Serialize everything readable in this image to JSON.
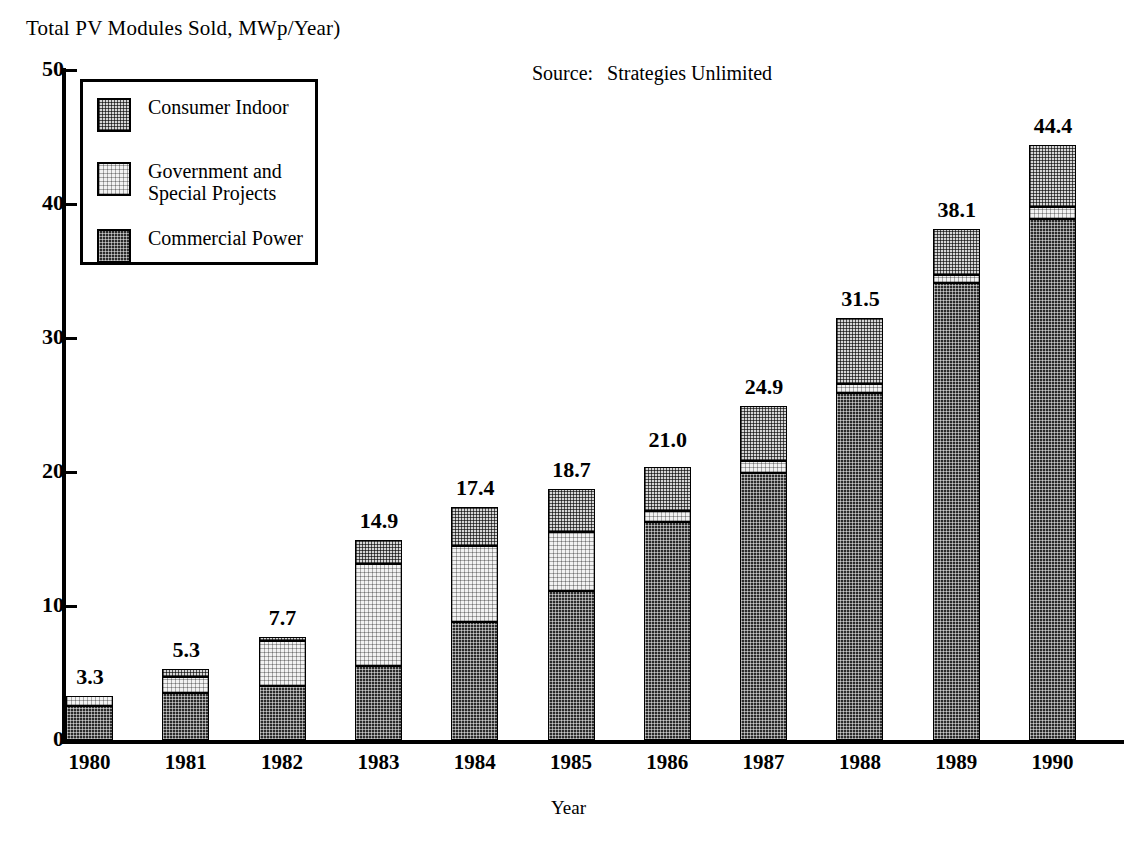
{
  "chart": {
    "y_axis_title": "Total PV Modules Sold, MWp/Year)",
    "x_axis_title": "Year",
    "source_label": "Source:",
    "source_value": "Strategies Unlimited"
  },
  "legend": {
    "items": [
      {
        "label": "Consumer Indoor",
        "swatch": "consumer-indoor-swatch",
        "color": "#d6d6d6"
      },
      {
        "label": "Government and\nSpecial Projects",
        "swatch": "government-special-projects-swatch",
        "color": "#f2f2f2"
      },
      {
        "label": "Commercial Power",
        "swatch": "commercial-power-swatch",
        "color": "#2b2b2b"
      }
    ]
  },
  "chart_data": {
    "type": "bar",
    "subtype": "stacked",
    "title": "Total PV Modules Sold, MWp/Year)",
    "xlabel": "Year",
    "ylabel": "Total PV Modules Sold, MWp/Year)",
    "ylim": [
      0,
      50
    ],
    "yticks": [
      0,
      10,
      20,
      30,
      40,
      50
    ],
    "ytick_labels": [
      "0",
      "10",
      "20",
      "30",
      "40",
      "50"
    ],
    "grid": false,
    "legend_position": "upper-left",
    "annotation": "Source:   Strategies Unlimited",
    "categories": [
      "1980",
      "1981",
      "1982",
      "1983",
      "1984",
      "1985",
      "1986",
      "1987",
      "1988",
      "1989",
      "1990"
    ],
    "series": [
      {
        "name": "Commercial Power",
        "color": "#2b2b2b",
        "values": [
          2.5,
          3.5,
          4.0,
          5.5,
          8.8,
          11.1,
          16.3,
          19.9,
          25.9,
          34.1,
          38.9
        ]
      },
      {
        "name": "Government and Special Projects",
        "color": "#f2f2f2",
        "values": [
          0.8,
          1.2,
          3.4,
          7.6,
          5.7,
          4.4,
          0.8,
          0.9,
          0.7,
          0.6,
          0.9
        ]
      },
      {
        "name": "Consumer Indoor",
        "color": "#d6d6d6",
        "values": [
          0.0,
          0.6,
          0.3,
          1.8,
          2.9,
          3.2,
          3.3,
          4.1,
          4.9,
          3.4,
          4.6
        ]
      }
    ],
    "totals": [
      3.3,
      5.3,
      7.7,
      14.9,
      17.4,
      18.7,
      21.0,
      24.9,
      31.5,
      38.1,
      44.4
    ],
    "total_labels": [
      "3.3",
      "5.3",
      "7.7",
      "14.9",
      "17.4",
      "18.7",
      "21.0",
      "24.9",
      "31.5",
      "38.1",
      "44.4"
    ]
  }
}
